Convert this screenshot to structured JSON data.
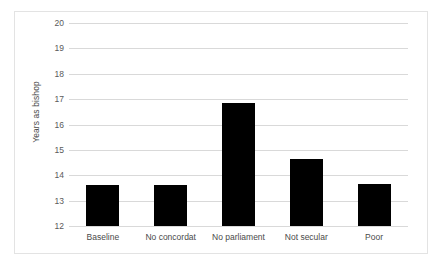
{
  "chart_data": {
    "type": "bar",
    "title": "",
    "subtitle": "",
    "xlabel": "",
    "ylabel": "Years as bishop",
    "categories": [
      "Baseline",
      "No concordat",
      "No parliament",
      "Not secular",
      "Poor"
    ],
    "values": [
      13.6,
      13.6,
      16.85,
      14.65,
      13.65
    ],
    "ylim": [
      12,
      20
    ],
    "yticks": [
      20,
      19,
      18,
      17,
      16,
      15,
      14,
      13,
      12
    ],
    "ytick_labels": [
      "20",
      "19",
      "18",
      "17",
      "16",
      "15",
      "14",
      "13",
      "12"
    ],
    "grid": true,
    "legend": false,
    "legend_position": "none",
    "series": [
      {
        "name": "Years as bishop",
        "values": [
          13.6,
          13.6,
          16.85,
          14.65,
          13.65
        ],
        "color": "#000000"
      }
    ],
    "colors": {
      "bar": "#000000",
      "gridline": "#d9d9d9",
      "border": "#e3e3e3",
      "tick_text": "#5a5a5a",
      "axis_title": "#4a4a4a",
      "background": "#ffffff"
    }
  }
}
